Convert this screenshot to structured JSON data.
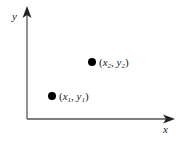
{
  "diagram": {
    "type": "coordinate-plane",
    "axes": {
      "x": {
        "label": "x"
      },
      "y": {
        "label": "y"
      }
    },
    "points": [
      {
        "id": "p1",
        "var_x": "x",
        "sub_x": "1",
        "var_y": "y",
        "sub_y": "1",
        "label": "(x1, y1)"
      },
      {
        "id": "p2",
        "var_x": "x",
        "sub_x": "2",
        "var_y": "y",
        "sub_y": "2",
        "label": "(x2, y2)"
      }
    ],
    "colors": {
      "axis": "#555555",
      "point": "#000000",
      "text": "#1a1a1a"
    }
  }
}
